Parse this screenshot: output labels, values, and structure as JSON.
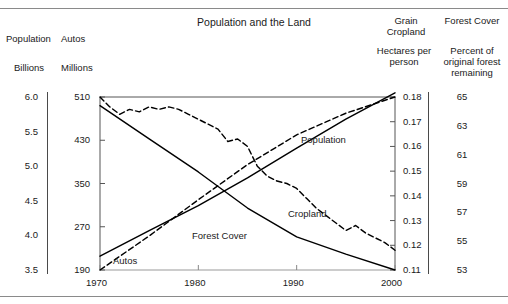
{
  "chart_data": {
    "type": "line",
    "title": "Population and the Land",
    "xlabel": "",
    "x": [
      1970,
      1975,
      1980,
      1985,
      1990,
      1995,
      2000
    ],
    "xlim": [
      1970,
      2000
    ],
    "xticks": [
      "1970",
      "1980",
      "1990",
      "2000"
    ],
    "grid": false,
    "legend_position": "inline-annotations",
    "axes": [
      {
        "id": "population",
        "name": "Population",
        "units": "Billions",
        "side": "left",
        "ticks": [
          "6.0",
          "5.5",
          "5.0",
          "4.5",
          "4.0",
          "3.5"
        ],
        "lim": [
          3.5,
          6.0
        ]
      },
      {
        "id": "autos",
        "name": "Autos",
        "units": "Millions",
        "side": "left",
        "ticks": [
          "510",
          "430",
          "350",
          "270",
          "190"
        ],
        "lim": [
          190,
          510
        ]
      },
      {
        "id": "grain_cropland",
        "name": "Grain Cropland",
        "units": "Hectares per person",
        "side": "right",
        "ticks": [
          "0.18",
          "0.17",
          "0.16",
          "0.15",
          "0.14",
          "0.13",
          "0.12",
          "0.11"
        ],
        "lim": [
          0.11,
          0.18
        ]
      },
      {
        "id": "forest_cover",
        "name": "Forest Cover",
        "units": "Percent of original forest remaining",
        "side": "right",
        "ticks": [
          "65",
          "63",
          "61",
          "59",
          "57",
          "55",
          "53"
        ],
        "lim": [
          53,
          65
        ]
      }
    ],
    "series": [
      {
        "name": "Population",
        "axis": "population",
        "style": "solid",
        "color": "#000000",
        "label_x": 1991.5,
        "x": [
          1970,
          1975,
          1980,
          1985,
          1990,
          1995,
          2000
        ],
        "values": [
          3.7,
          4.07,
          4.43,
          4.83,
          5.26,
          5.68,
          6.06
        ]
      },
      {
        "name": "Autos",
        "axis": "autos",
        "style": "dashed",
        "color": "#000000",
        "label_x": 1972.5,
        "x": [
          1970,
          1975,
          1980,
          1985,
          1990,
          1995,
          2000
        ],
        "values": [
          190,
          253,
          320,
          385,
          440,
          480,
          510
        ]
      },
      {
        "name": "Forest Cover",
        "axis": "forest_cover",
        "style": "solid",
        "color": "#000000",
        "label_x": 1980.5,
        "x": [
          1970,
          1975,
          1980,
          1985,
          1990,
          1995,
          2000
        ],
        "values": [
          64.4,
          62.1,
          59.8,
          57.3,
          55.3,
          54.1,
          53.0
        ]
      },
      {
        "name": "Cropland",
        "axis": "grain_cropland",
        "style": "dashed",
        "color": "#000000",
        "label_x": 1989.5,
        "x": [
          1970,
          1971,
          1972,
          1973,
          1974,
          1975,
          1976,
          1977,
          1978,
          1979,
          1980,
          1981,
          1982,
          1983,
          1984,
          1985,
          1986,
          1987,
          1988,
          1989,
          1990,
          1991,
          1992,
          1993,
          1994,
          1995,
          1996,
          1997,
          1998,
          1999,
          2000
        ],
        "values": [
          0.18,
          0.176,
          0.173,
          0.175,
          0.174,
          0.176,
          0.175,
          0.176,
          0.175,
          0.173,
          0.171,
          0.169,
          0.167,
          0.162,
          0.163,
          0.16,
          0.152,
          0.148,
          0.146,
          0.145,
          0.143,
          0.139,
          0.135,
          0.132,
          0.129,
          0.126,
          0.128,
          0.125,
          0.123,
          0.121,
          0.118
        ]
      }
    ]
  },
  "header": {
    "title": "Population and the Land",
    "population_label": "Population",
    "autos_label": "Autos",
    "billions_label": "Billions",
    "millions_label": "Millions",
    "grain_label": "Grain Cropland",
    "forest_label": "Forest Cover",
    "hectares_label": "Hectares per person",
    "pct_forest_label": "Percent of original forest remaining"
  },
  "series_labels": {
    "population": "Population",
    "autos": "Autos",
    "forest_cover": "Forest Cover",
    "cropland": "Cropland"
  },
  "colors": {
    "ink": "#000000",
    "rule": "#8a8a8a",
    "axis": "#4a4a4a"
  }
}
